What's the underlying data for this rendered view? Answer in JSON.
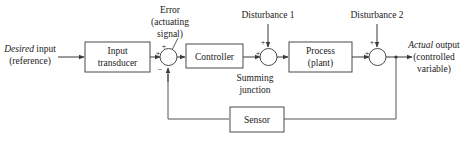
{
  "diagram": {
    "background_color": "#ffffff",
    "line_color": "#4a4a4a",
    "text_color": "#1a1a1a",
    "blocks": [
      {
        "id": "input-transducer",
        "line1": "Input",
        "line2": "transducer"
      },
      {
        "id": "controller",
        "line1": "Controller",
        "line2": ""
      },
      {
        "id": "process",
        "line1": "Process",
        "line2": "(plant)"
      },
      {
        "id": "sensor",
        "line1": "Sensor",
        "line2": ""
      }
    ],
    "summing_junctions": [
      {
        "id": "sum-1",
        "top_sign": "+",
        "left_sign": "+",
        "bottom_sign": "−"
      },
      {
        "id": "sum-2",
        "top_sign": "+",
        "left_sign": "+"
      },
      {
        "id": "sum-3",
        "top_sign": "+",
        "left_sign": "+"
      }
    ],
    "annotations": {
      "input_label_em": "Desired",
      "input_label_rest": " input",
      "input_label_line2": "(reference)",
      "error_line1": "Error",
      "error_line2": "(actuating",
      "error_line3": "signal)",
      "disturbance_1": "Disturbance 1",
      "disturbance_2": "Disturbance 2",
      "summing_junction_line1": "Summing",
      "summing_junction_line2": "junction",
      "output_label_em": "Actual",
      "output_label_rest": " output",
      "output_label_line2": "(controlled",
      "output_label_line3": "variable)"
    }
  }
}
